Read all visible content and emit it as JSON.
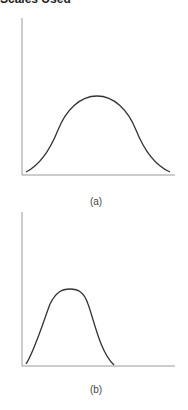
{
  "header": {
    "title": "Scales Used"
  },
  "figures": [
    {
      "label": "(a)",
      "description": "Wide bell-shaped curve"
    },
    {
      "label": "(b)",
      "description": "Narrow bell-shaped curve skewed left"
    }
  ],
  "colors": {
    "axis": "#9a9a9a",
    "curve": "#333333",
    "text": "#444444"
  }
}
